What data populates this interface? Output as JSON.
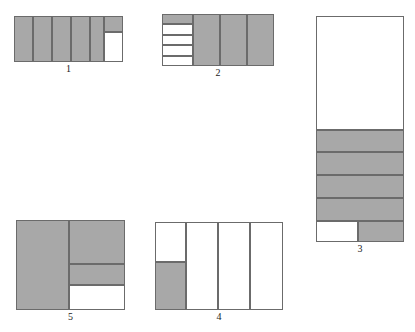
{
  "page": {
    "background_color": "#ffffff",
    "width": 415,
    "height": 332
  },
  "style": {
    "fill_color": "#a8a8a8",
    "empty_color": "#ffffff",
    "stroke_color": "#6b6b6b",
    "caption_color": "#1a1a1a"
  },
  "figures": [
    {
      "id": "figure-1",
      "caption": "1",
      "box": {
        "x": 14,
        "y": 16,
        "w": 109,
        "h": 46
      },
      "caption_box": {
        "x": 14,
        "y": 63,
        "w": 109
      },
      "cells": [
        {
          "name": "cell-1-a",
          "x": 0,
          "y": 0,
          "w": 19,
          "h": 46,
          "fill": true
        },
        {
          "name": "cell-1-b",
          "x": 19,
          "y": 0,
          "w": 19,
          "h": 46,
          "fill": true
        },
        {
          "name": "cell-1-c",
          "x": 38,
          "y": 0,
          "w": 19,
          "h": 46,
          "fill": true
        },
        {
          "name": "cell-1-d",
          "x": 57,
          "y": 0,
          "w": 19,
          "h": 46,
          "fill": true
        },
        {
          "name": "cell-1-e",
          "x": 76,
          "y": 0,
          "w": 14,
          "h": 46,
          "fill": true
        },
        {
          "name": "cell-1-f",
          "x": 90,
          "y": 0,
          "w": 19,
          "h": 16,
          "fill": true
        },
        {
          "name": "cell-1-g",
          "x": 90,
          "y": 16,
          "w": 19,
          "h": 30,
          "fill": false
        }
      ]
    },
    {
      "id": "figure-2",
      "caption": "2",
      "box": {
        "x": 162,
        "y": 14,
        "w": 112,
        "h": 52
      },
      "caption_box": {
        "x": 162,
        "y": 67,
        "w": 112
      },
      "cells": [
        {
          "name": "cell-2-a",
          "x": 0,
          "y": 0,
          "w": 31,
          "h": 10,
          "fill": true
        },
        {
          "name": "cell-2-b",
          "x": 0,
          "y": 10,
          "w": 31,
          "h": 11,
          "fill": false
        },
        {
          "name": "cell-2-c",
          "x": 0,
          "y": 21,
          "w": 31,
          "h": 10,
          "fill": false
        },
        {
          "name": "cell-2-d",
          "x": 0,
          "y": 31,
          "w": 31,
          "h": 11,
          "fill": false
        },
        {
          "name": "cell-2-e",
          "x": 0,
          "y": 42,
          "w": 31,
          "h": 10,
          "fill": false
        },
        {
          "name": "cell-2-f",
          "x": 31,
          "y": 0,
          "w": 27,
          "h": 52,
          "fill": true
        },
        {
          "name": "cell-2-g",
          "x": 58,
          "y": 0,
          "w": 27,
          "h": 52,
          "fill": true
        },
        {
          "name": "cell-2-h",
          "x": 85,
          "y": 0,
          "w": 27,
          "h": 52,
          "fill": true
        }
      ]
    },
    {
      "id": "figure-3",
      "caption": "3",
      "box": {
        "x": 316,
        "y": 16,
        "w": 88,
        "h": 226
      },
      "caption_box": {
        "x": 316,
        "y": 243,
        "w": 88
      },
      "cells": [
        {
          "name": "cell-3-a",
          "x": 0,
          "y": 0,
          "w": 88,
          "h": 114,
          "fill": false
        },
        {
          "name": "cell-3-b",
          "x": 0,
          "y": 114,
          "w": 88,
          "h": 22,
          "fill": true
        },
        {
          "name": "cell-3-c",
          "x": 0,
          "y": 136,
          "w": 88,
          "h": 23,
          "fill": true
        },
        {
          "name": "cell-3-d",
          "x": 0,
          "y": 159,
          "w": 88,
          "h": 23,
          "fill": true
        },
        {
          "name": "cell-3-e",
          "x": 0,
          "y": 182,
          "w": 88,
          "h": 23,
          "fill": true
        },
        {
          "name": "cell-3-f",
          "x": 0,
          "y": 205,
          "w": 42,
          "h": 21,
          "fill": false
        },
        {
          "name": "cell-3-g",
          "x": 42,
          "y": 205,
          "w": 46,
          "h": 21,
          "fill": true
        }
      ]
    },
    {
      "id": "figure-4",
      "caption": "4",
      "box": {
        "x": 155,
        "y": 222,
        "w": 128,
        "h": 88
      },
      "caption_box": {
        "x": 155,
        "y": 311,
        "w": 128
      },
      "cells": [
        {
          "name": "cell-4-a",
          "x": 0,
          "y": 0,
          "w": 31,
          "h": 40,
          "fill": false
        },
        {
          "name": "cell-4-b",
          "x": 0,
          "y": 40,
          "w": 31,
          "h": 48,
          "fill": true
        },
        {
          "name": "cell-4-c",
          "x": 31,
          "y": 0,
          "w": 32,
          "h": 88,
          "fill": false
        },
        {
          "name": "cell-4-d",
          "x": 63,
          "y": 0,
          "w": 32,
          "h": 88,
          "fill": false
        },
        {
          "name": "cell-4-e",
          "x": 95,
          "y": 0,
          "w": 33,
          "h": 88,
          "fill": false
        }
      ]
    },
    {
      "id": "figure-5",
      "caption": "5",
      "box": {
        "x": 16,
        "y": 220,
        "w": 109,
        "h": 90
      },
      "caption_box": {
        "x": 16,
        "y": 311,
        "w": 109
      },
      "cells": [
        {
          "name": "cell-5-a",
          "x": 0,
          "y": 0,
          "w": 53,
          "h": 90,
          "fill": true
        },
        {
          "name": "cell-5-b",
          "x": 53,
          "y": 0,
          "w": 56,
          "h": 44,
          "fill": true
        },
        {
          "name": "cell-5-c",
          "x": 53,
          "y": 44,
          "w": 56,
          "h": 21,
          "fill": true
        },
        {
          "name": "cell-5-d",
          "x": 53,
          "y": 65,
          "w": 56,
          "h": 25,
          "fill": false
        }
      ]
    }
  ]
}
